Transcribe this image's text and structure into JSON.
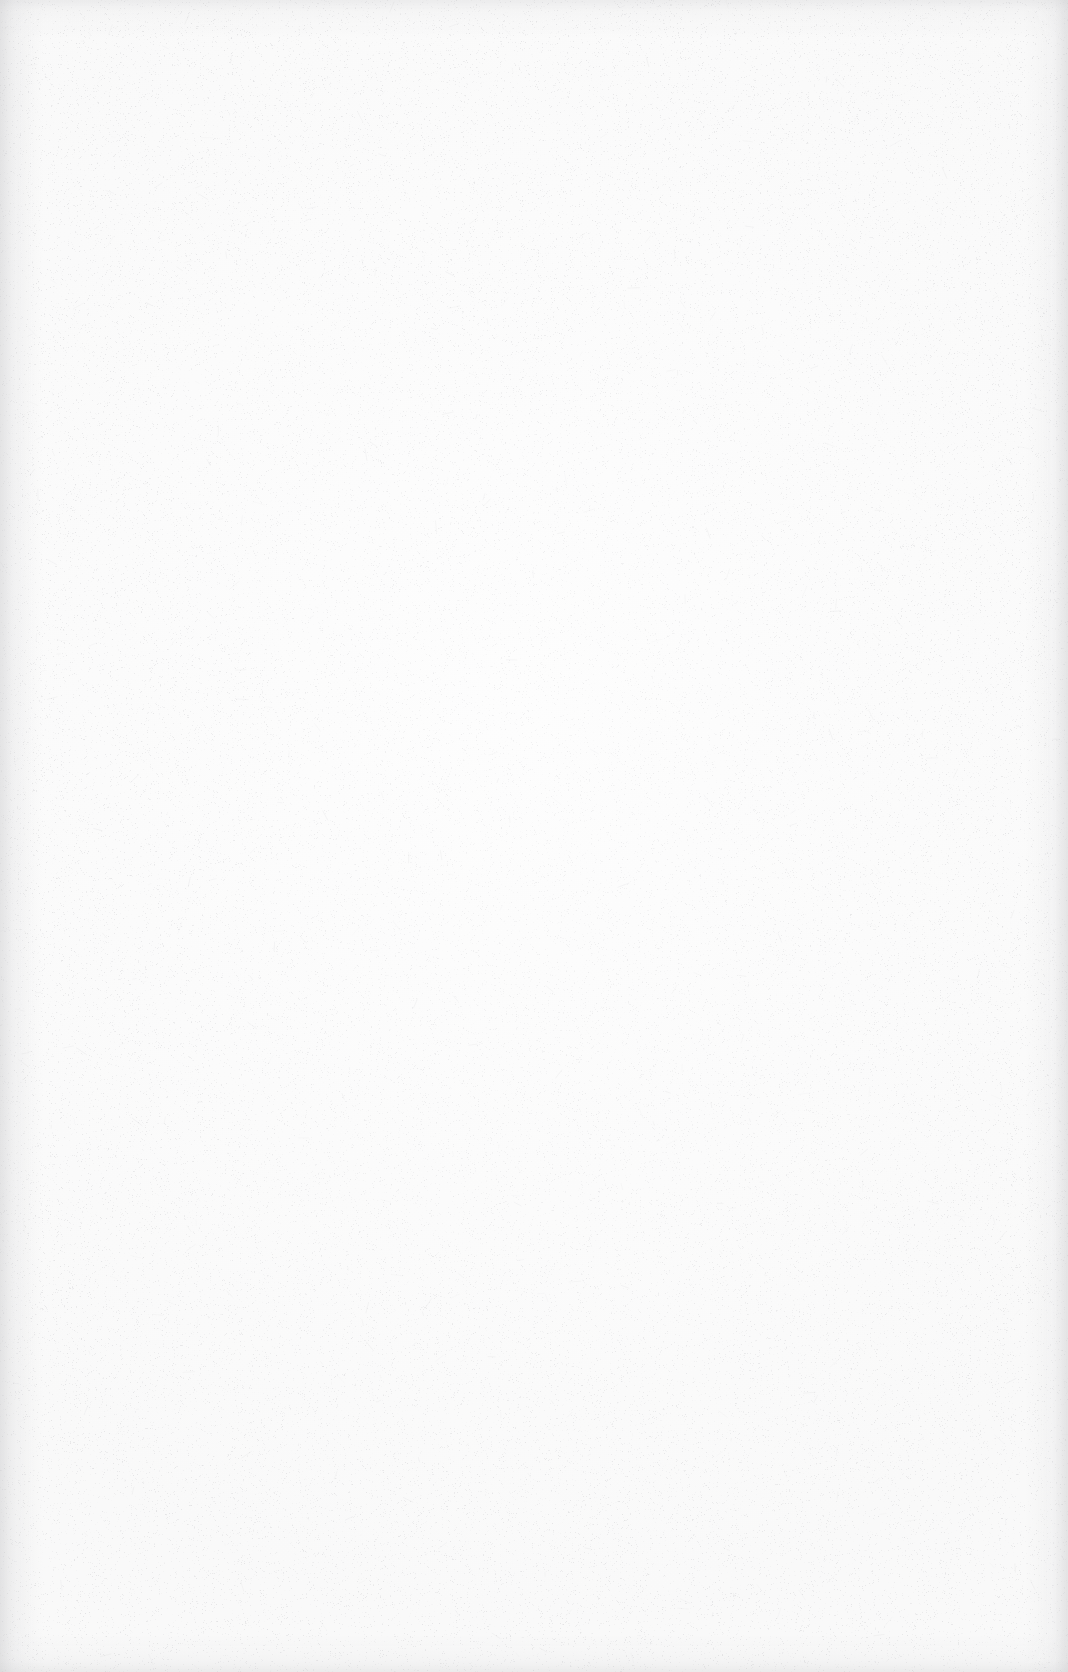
{
  "document": {
    "page_kind": "blank-scanned-page",
    "visible_text": "",
    "header_text": "",
    "footer_text": "",
    "page_number": "",
    "body_lines": [],
    "figures": [],
    "tables": []
  },
  "appearance": {
    "page_width_px": 1068,
    "page_height_px": 1672,
    "paper_color": "#FBFBFB",
    "paper_highlight_color": "#FDFDFD",
    "paper_shadow_color": "#F7F7F8",
    "grain_color": "#C9C9CC",
    "edge_shadow_color": "#C6C6C8",
    "grain_density": 0.055,
    "grain_max_opacity": 0.3
  }
}
